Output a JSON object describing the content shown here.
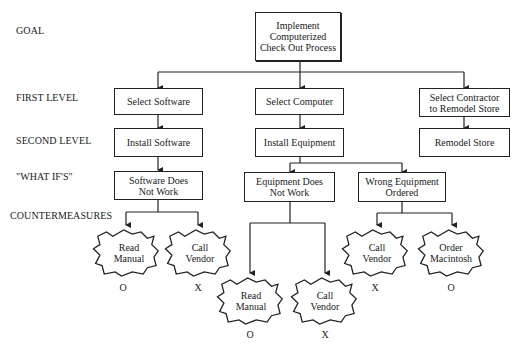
{
  "levels": {
    "goal": "GOAL",
    "first": "FIRST LEVEL",
    "second": "SECOND LEVEL",
    "whatifs": "\"WHAT IF'S\"",
    "countermeasures": "COUNTERMEASURES"
  },
  "goal": {
    "line1": "Implement",
    "line2": "Computerized",
    "line3": "Check Out Process"
  },
  "first_level": [
    {
      "label": "Select Software"
    },
    {
      "label": "Select Computer"
    },
    {
      "line1": "Select Contractor",
      "line2": "to Remodel Store"
    }
  ],
  "second_level": [
    {
      "label": "Install Software"
    },
    {
      "label": "Install Equipment"
    },
    {
      "label": "Remodel Store"
    }
  ],
  "what_ifs": [
    {
      "line1": "Software Does",
      "line2": "Not Work"
    },
    {
      "line1": "Equipment Does",
      "line2": "Not Work"
    },
    {
      "line1": "Wrong Equipment",
      "line2": "Ordered"
    }
  ],
  "countermeasures": [
    {
      "line1": "Read",
      "line2": "Manual",
      "mark": "O"
    },
    {
      "line1": "Call",
      "line2": "Vendor",
      "mark": "X"
    },
    {
      "line1": "Read",
      "line2": "Manual",
      "mark": "O"
    },
    {
      "line1": "Call",
      "line2": "Vendor",
      "mark": "X"
    },
    {
      "line1": "Call",
      "line2": "Vendor",
      "mark": "X"
    },
    {
      "line1": "Order",
      "line2": "Macintosh",
      "mark": "O"
    }
  ]
}
